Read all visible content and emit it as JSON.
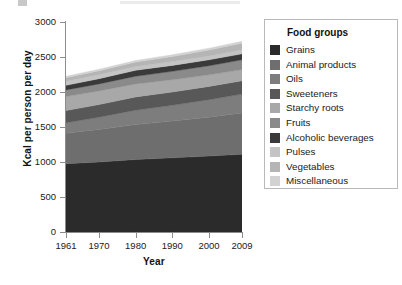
{
  "chart_data": {
    "type": "area",
    "stacked": true,
    "title": "",
    "xlabel": "Year",
    "ylabel": "Kcal per person per day",
    "x": [
      1961,
      1970,
      1980,
      1990,
      2000,
      2009
    ],
    "xtick_labels": [
      "1961",
      "1970",
      "1980",
      "1990",
      "2000",
      "2009"
    ],
    "ytick_labels": [
      "0",
      "500",
      "1000",
      "1500",
      "2000",
      "2500",
      "3000"
    ],
    "ytick_values": [
      0,
      500,
      1000,
      1500,
      2000,
      2500,
      3000
    ],
    "xlim": [
      1961,
      2009
    ],
    "ylim": [
      0,
      3000
    ],
    "grid": false,
    "legend_position": "right",
    "legend_title": "Food groups",
    "series": [
      {
        "name": "Grains",
        "color": "#2b2b2b",
        "values": [
          975,
          1000,
          1035,
          1060,
          1085,
          1110
        ]
      },
      {
        "name": "Animal products",
        "color": "#6e6e6e",
        "values": [
          435,
          465,
          500,
          525,
          555,
          590
        ]
      },
      {
        "name": "Oils",
        "color": "#7d7d7d",
        "values": [
          150,
          175,
          205,
          225,
          250,
          270
        ]
      },
      {
        "name": "Sweeteners",
        "color": "#585858",
        "values": [
          175,
          180,
          190,
          190,
          190,
          190
        ]
      },
      {
        "name": "Starchy roots",
        "color": "#a8a8a8",
        "values": [
          200,
          195,
          185,
          175,
          165,
          160
        ]
      },
      {
        "name": "Fruits",
        "color": "#8a8a8a",
        "values": [
          95,
          100,
          110,
          120,
          130,
          140
        ]
      },
      {
        "name": "Alcoholic beverages",
        "color": "#3a3a3a",
        "values": [
          65,
          75,
          85,
          85,
          85,
          85
        ]
      },
      {
        "name": "Pulses",
        "color": "#c4c4c4",
        "values": [
          60,
          58,
          55,
          55,
          55,
          58
        ]
      },
      {
        "name": "Vegetables",
        "color": "#b5b5b5",
        "values": [
          50,
          55,
          62,
          72,
          85,
          95
        ]
      },
      {
        "name": "Miscellaneous",
        "color": "#d2d2d2",
        "values": [
          20,
          22,
          24,
          25,
          26,
          27
        ]
      }
    ],
    "totals": [
      2225,
      2325,
      2451,
      2532,
      2626,
      2725
    ]
  },
  "legend": {
    "title": "Food groups",
    "items": [
      {
        "label": "Grains",
        "color": "#2b2b2b"
      },
      {
        "label": "Animal products",
        "color": "#6e6e6e"
      },
      {
        "label": "Oils",
        "color": "#7d7d7d"
      },
      {
        "label": "Sweeteners",
        "color": "#585858"
      },
      {
        "label": "Starchy roots",
        "color": "#a8a8a8"
      },
      {
        "label": "Fruits",
        "color": "#8a8a8a"
      },
      {
        "label": "Alcoholic beverages",
        "color": "#3a3a3a"
      },
      {
        "label": "Pulses",
        "color": "#c4c4c4"
      },
      {
        "label": "Vegetables",
        "color": "#b5b5b5"
      },
      {
        "label": "Miscellaneous",
        "color": "#d2d2d2"
      }
    ]
  },
  "axes": {
    "x_title": "Year",
    "y_title": "Kcal per person per day"
  }
}
